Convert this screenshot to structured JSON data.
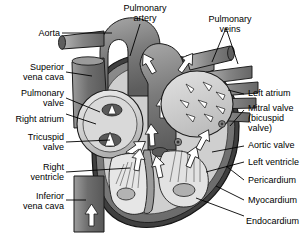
{
  "figure": {
    "background": "#ffffff",
    "text_color": "#000000",
    "leader_color": "#000000"
  },
  "palette": {
    "vessel_dark": "#6f6f6f",
    "vessel_mid": "#8d8d8d",
    "vessel_light": "#b9b9b9",
    "chamber_light": "#d8d8d8",
    "chamber_pale": "#e8e8e8",
    "myocardium": "#7a7a7a",
    "pericardium": "#4a4a4a",
    "endocardium": "#c9c9c9",
    "arrow_fill": "#ffffff",
    "outline": "#1a1a1a"
  },
  "labels": {
    "aorta": "Aorta",
    "superior_vena_cava": "Superior\nvena cava",
    "pulmonary_valve": "Pulmonary\nvalve",
    "right_atrium": "Right atrium",
    "tricuspid_valve": "Tricuspid\nvalve",
    "right_ventricle": "Right\nventricle",
    "inferior_vena_cava": "Inferior\nvena cava",
    "pulmonary_artery": "Pulmonary\nartery",
    "pulmonary_veins": "Pulmonary\nveins",
    "left_atrium": "Left atrium",
    "mitral_valve": "Mitral valve\n(bicuspid\nvalve)",
    "aortic_valve": "Aortic valve",
    "left_ventricle": "Left ventricle",
    "pericardium": "Pericardium",
    "myocardium": "Myocardium",
    "endocardium": "Endocardium"
  },
  "structures": [
    {
      "name": "aorta",
      "side": "left"
    },
    {
      "name": "superior-vena-cava",
      "side": "left"
    },
    {
      "name": "pulmonary-valve",
      "side": "left"
    },
    {
      "name": "right-atrium",
      "side": "left"
    },
    {
      "name": "tricuspid-valve",
      "side": "left"
    },
    {
      "name": "right-ventricle",
      "side": "left"
    },
    {
      "name": "inferior-vena-cava",
      "side": "left"
    },
    {
      "name": "pulmonary-artery",
      "side": "top"
    },
    {
      "name": "pulmonary-veins",
      "side": "top"
    },
    {
      "name": "left-atrium",
      "side": "right"
    },
    {
      "name": "mitral-valve",
      "side": "right"
    },
    {
      "name": "aortic-valve",
      "side": "right"
    },
    {
      "name": "left-ventricle",
      "side": "right"
    },
    {
      "name": "pericardium",
      "side": "right"
    },
    {
      "name": "myocardium",
      "side": "right"
    },
    {
      "name": "endocardium",
      "side": "right"
    }
  ]
}
